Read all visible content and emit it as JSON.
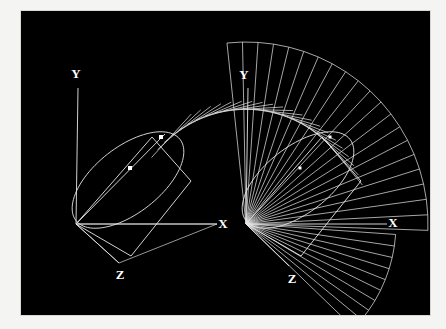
{
  "figure": {
    "background_color": "#000000",
    "plate_border_color": "#f4f4f2",
    "line_color": "#e9e9e9",
    "marker_color": "#ffffff"
  },
  "panels": [
    {
      "id": "left",
      "name": "single-frame",
      "origin": {
        "x": 76,
        "y": 224
      },
      "axes": [
        {
          "name": "X",
          "label": "X",
          "label_pos": {
            "x": 223,
            "y": 225
          },
          "end": {
            "x": 217,
            "y": 224
          }
        },
        {
          "name": "Y",
          "label": "Y",
          "label_pos": {
            "x": 76,
            "y": 75
          },
          "end": {
            "x": 78,
            "y": 88
          }
        },
        {
          "name": "Z",
          "label": "Z",
          "label_pos": {
            "x": 120,
            "y": 276
          },
          "end": {
            "x": 119,
            "y": 263
          }
        }
      ],
      "quadrilateral": [
        {
          "x": 76,
          "y": 224
        },
        {
          "x": 152,
          "y": 137
        },
        {
          "x": 191,
          "y": 181
        },
        {
          "x": 131,
          "y": 256
        }
      ],
      "ellipse": {
        "center": {
          "x": 128,
          "y": 180
        },
        "rx": 66,
        "ry": 33,
        "rotation_deg": -38
      },
      "ray": {
        "from": {
          "x": 76,
          "y": 224
        },
        "to": {
          "x": 165,
          "y": 134
        }
      },
      "markers": [
        {
          "x": 161,
          "y": 137,
          "size": 4
        },
        {
          "x": 130,
          "y": 168,
          "size": 4
        }
      ],
      "base_triangle": [
        {
          "x": 76,
          "y": 224
        },
        {
          "x": 119,
          "y": 263
        },
        {
          "x": 217,
          "y": 224
        }
      ]
    },
    {
      "id": "right",
      "name": "swept-frame",
      "origin": {
        "x": 246,
        "y": 224
      },
      "axes": [
        {
          "name": "X",
          "label": "X",
          "label_pos": {
            "x": 393,
            "y": 224
          },
          "end": {
            "x": 387,
            "y": 224
          }
        },
        {
          "name": "Y",
          "label": "Y",
          "label_pos": {
            "x": 244,
            "y": 76
          },
          "end": {
            "x": 248,
            "y": 88
          }
        },
        {
          "name": "Z",
          "label": "Z",
          "label_pos": {
            "x": 292,
            "y": 280
          },
          "end": {
            "x": 289,
            "y": 266
          }
        }
      ],
      "quadrilateral": [
        {
          "x": 246,
          "y": 224
        },
        {
          "x": 322,
          "y": 137
        },
        {
          "x": 361,
          "y": 181
        },
        {
          "x": 301,
          "y": 256
        }
      ],
      "ellipse": {
        "center": {
          "x": 298,
          "y": 180
        },
        "rx": 66,
        "ry": 33,
        "rotation_deg": -38
      },
      "markers": [
        {
          "x": 330,
          "y": 137,
          "size": 3
        },
        {
          "x": 300,
          "y": 168,
          "size": 3
        }
      ],
      "sweep": {
        "description": "rotational fan of the quadrilateral about the origin",
        "ray_count": 21,
        "start_angle_deg": -96,
        "end_angle_deg": 2,
        "inner_radius": 0,
        "outer_radius": 182,
        "arc_chord_steps": 20
      },
      "base_fan": {
        "ray_count": 10,
        "start_angle_deg": 4,
        "end_angle_deg": 44,
        "radius": 150
      }
    }
  ]
}
